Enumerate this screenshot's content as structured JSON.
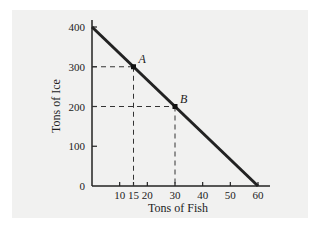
{
  "chart_data": {
    "type": "line",
    "title": "",
    "xlabel": "Tons of Fish",
    "ylabel": "Tons of Ice",
    "x_ticks": [
      10,
      15,
      20,
      30,
      40,
      50,
      60
    ],
    "x_tick_labels": [
      "10",
      "15",
      "20",
      "30",
      "40",
      "50",
      "60"
    ],
    "y_ticks": [
      0,
      100,
      200,
      300,
      400
    ],
    "y_tick_labels": [
      "0",
      "100",
      "200",
      "300",
      "400"
    ],
    "xlim": [
      0,
      64
    ],
    "ylim": [
      0,
      410
    ],
    "grid": false,
    "series": [
      {
        "name": "Production possibilities frontier",
        "x": [
          0,
          60
        ],
        "y": [
          400,
          0
        ]
      }
    ],
    "points": [
      {
        "label": "A",
        "x": 15,
        "y": 300
      },
      {
        "label": "B",
        "x": 30,
        "y": 200
      }
    ],
    "annotations": [
      "Dashed guide lines from A to x=15 and y=300",
      "Dashed guide lines from B to x=30 and y=200"
    ],
    "colors": {
      "line": "#222222",
      "background": "#f1f1f0"
    }
  }
}
